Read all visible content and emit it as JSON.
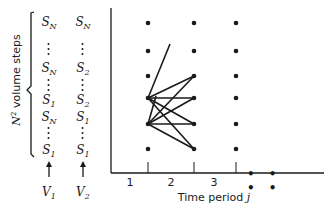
{
  "diagram": {
    "y_axis_label": {
      "prefix": "N",
      "superscript": "2",
      "text": " volume steps"
    },
    "x_axis_label": {
      "text": "Time period ",
      "var": "j"
    },
    "x_ticks": [
      "1",
      "2",
      "3"
    ],
    "x_ellipsis": "• • • •",
    "columns": [
      {
        "name": "V",
        "sub": "1",
        "entries": [
          {
            "type": "label",
            "sym": "S",
            "sub": "N",
            "y": 22
          },
          {
            "type": "dots",
            "y": 43
          },
          {
            "type": "label",
            "sym": "S",
            "sub": "N",
            "y": 68
          },
          {
            "type": "dots",
            "y": 79
          },
          {
            "type": "label",
            "sym": "S",
            "sub": "1",
            "y": 100
          },
          {
            "type": "label",
            "sym": "S",
            "sub": "N",
            "y": 117
          },
          {
            "type": "dots",
            "y": 127
          },
          {
            "type": "label",
            "sym": "S",
            "sub": "1",
            "y": 150
          }
        ]
      },
      {
        "name": "V",
        "sub": "2",
        "entries": [
          {
            "type": "label",
            "sym": "S",
            "sub": "N",
            "y": 22
          },
          {
            "type": "dots",
            "y": 43
          },
          {
            "type": "label",
            "sym": "S",
            "sub": "2",
            "y": 68
          },
          {
            "type": "dots",
            "y": 79
          },
          {
            "type": "label",
            "sym": "S",
            "sub": "2",
            "y": 100
          },
          {
            "type": "label",
            "sym": "S",
            "sub": "1",
            "y": 117
          },
          {
            "type": "dots",
            "y": 127
          },
          {
            "type": "label",
            "sym": "S",
            "sub": "1",
            "y": 150
          }
        ]
      }
    ],
    "grid": {
      "column_x": [
        148,
        194,
        236
      ],
      "row_y": [
        23,
        51,
        76,
        98,
        124,
        149
      ]
    },
    "edges": [
      {
        "from": [
          148,
          98
        ],
        "to": [
          170,
          44
        ]
      },
      {
        "from": [
          148,
          98
        ],
        "to": [
          194,
          76
        ]
      },
      {
        "from": [
          148,
          98
        ],
        "to": [
          194,
          98
        ]
      },
      {
        "from": [
          148,
          98
        ],
        "to": [
          194,
          124
        ]
      },
      {
        "from": [
          148,
          98
        ],
        "to": [
          194,
          149
        ]
      },
      {
        "from": [
          148,
          124
        ],
        "to": [
          194,
          76
        ]
      },
      {
        "from": [
          148,
          124
        ],
        "to": [
          194,
          98
        ]
      },
      {
        "from": [
          148,
          124
        ],
        "to": [
          194,
          124
        ]
      },
      {
        "from": [
          148,
          124
        ],
        "to": [
          194,
          149
        ]
      },
      {
        "from": [
          148,
          124
        ],
        "to": [
          156,
          96
        ]
      }
    ],
    "colors": {
      "ink": "#1a1a1a",
      "background": "#ffffff"
    }
  }
}
